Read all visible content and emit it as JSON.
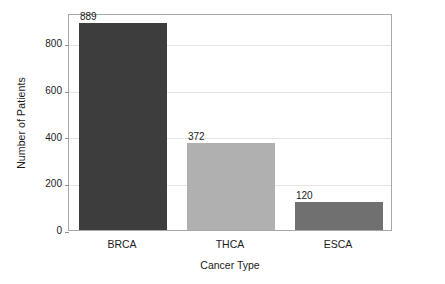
{
  "chart_data": {
    "type": "bar",
    "title": "",
    "subtitle": "",
    "xlabel": "Cancer Type",
    "ylabel": "Number of Patients",
    "categories": [
      "BRCA",
      "THCA",
      "ESCA"
    ],
    "values": [
      889,
      372,
      120
    ],
    "value_labels": [
      "889",
      "372",
      "120"
    ],
    "series": [
      {
        "name": "Number of Patients",
        "values": [
          889,
          372,
          120
        ]
      }
    ],
    "ylim": [
      0,
      930
    ],
    "xlim": [
      0,
      3
    ],
    "yticks": [
      0,
      200,
      400,
      600,
      800
    ],
    "ytick_labels": [
      "0",
      "200",
      "400",
      "600",
      "800"
    ],
    "grid": "horizontal",
    "legend": "none",
    "bar_colors": [
      "#3d3d3d",
      "#b0b0b0",
      "#707070"
    ],
    "annotations": [
      "889",
      "372",
      "120"
    ],
    "plot_background": "#ffffff",
    "axis_color": "#a8a8a8",
    "gridline_color": "#e4e4e4"
  },
  "axes": {
    "y_title": "Number of Patients",
    "x_title": "Cancer Type"
  }
}
